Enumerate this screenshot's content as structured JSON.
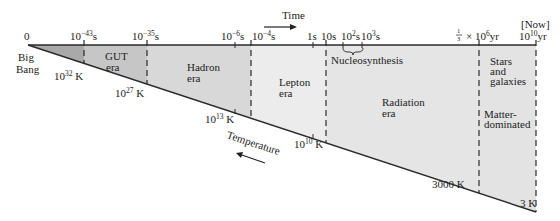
{
  "title": "Time",
  "temperature_label": "Temperature",
  "time_axis": {
    "labels": [
      {
        "id": "t0",
        "base": "0",
        "exp": "",
        "unit": ""
      },
      {
        "id": "t43",
        "base": "10",
        "exp": "−43",
        "unit": "s"
      },
      {
        "id": "t35",
        "base": "10",
        "exp": "−35",
        "unit": "s"
      },
      {
        "id": "t6",
        "base": "10",
        "exp": "−6",
        "unit": "s"
      },
      {
        "id": "t4",
        "base": "10",
        "exp": "−4",
        "unit": "s"
      },
      {
        "id": "t1s",
        "base": "1s",
        "exp": "",
        "unit": ""
      },
      {
        "id": "t10s",
        "base": "10s",
        "exp": "",
        "unit": ""
      },
      {
        "id": "t2",
        "base": "10",
        "exp": "2",
        "unit": "s"
      },
      {
        "id": "t3",
        "base": "10",
        "exp": "3",
        "unit": "s"
      },
      {
        "id": "tthird",
        "frac_num": "1",
        "frac_den": "3",
        "base": "× 10",
        "exp": "6",
        "unit": "yr"
      },
      {
        "id": "tnow",
        "top": "[Now]",
        "base": "10",
        "exp": "10",
        "unit": "yr"
      }
    ]
  },
  "temperatures": [
    {
      "id": "k32",
      "base": "10",
      "exp": "32",
      "unit": " K"
    },
    {
      "id": "k27",
      "base": "10",
      "exp": "27",
      "unit": " K"
    },
    {
      "id": "k13",
      "base": "10",
      "exp": "13",
      "unit": " K"
    },
    {
      "id": "k10",
      "base": "10",
      "exp": "10",
      "unit": " K"
    },
    {
      "id": "k3000",
      "text": "3000 K"
    },
    {
      "id": "k3",
      "text": "3 K"
    }
  ],
  "eras": {
    "big_bang": [
      "Big",
      "Bang"
    ],
    "gut": [
      "GUT",
      "era"
    ],
    "hadron": [
      "Hadron",
      "era"
    ],
    "lepton": [
      "Lepton",
      "era"
    ],
    "nucleosynthesis": "Nucleosynthesis",
    "radiation": [
      "Radiation",
      "era"
    ],
    "stars": [
      "Stars",
      "and",
      "galaxies"
    ],
    "matter": [
      "Matter-",
      "dominated"
    ]
  },
  "colors": {
    "planck": "#a9a9a9",
    "gut": "#c6c6c6",
    "hadron": "#d8d8d8",
    "lepton": "#ececec",
    "radiation": "#e5e5e5",
    "stars": "#e3e3e3",
    "line": "#2a2a2a"
  }
}
